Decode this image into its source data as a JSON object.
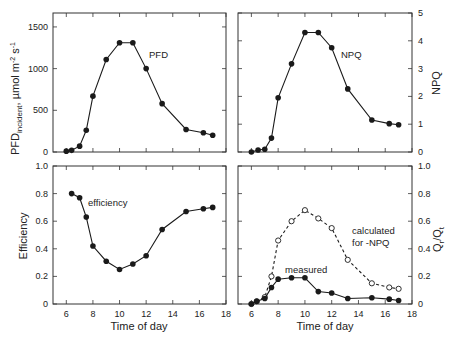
{
  "chart_data": [
    {
      "id": "pfd",
      "type": "line",
      "panel": "top-left",
      "xlabel": "",
      "ylabel": "PFD_incident, µmol m^-2 s^-1",
      "ylabel_main": "PFD",
      "ylabel_sub": "incident",
      "ylabel_units": ", µmol m",
      "xlim": [
        5,
        18
      ],
      "ylim": [
        0,
        1667
      ],
      "yticks": [
        0,
        500,
        1000,
        1500
      ],
      "xticks": [
        6,
        8,
        10,
        12,
        14,
        16,
        18
      ],
      "y_axis_side": "left",
      "annotation": {
        "text": "PFD",
        "x": 12.3,
        "y": 1140
      },
      "series": [
        {
          "name": "PFD",
          "marker": "filled-circle",
          "line": "solid",
          "x": [
            6.0,
            6.4,
            7.0,
            7.5,
            8.0,
            9.0,
            10.0,
            11.0,
            12.0,
            13.2,
            15.0,
            16.3,
            17.0
          ],
          "y": [
            10,
            20,
            70,
            260,
            670,
            1110,
            1310,
            1310,
            1000,
            580,
            270,
            230,
            200
          ]
        }
      ]
    },
    {
      "id": "npq",
      "type": "line",
      "panel": "top-right",
      "xlabel": "",
      "ylabel": "NPQ",
      "xlim": [
        5,
        18
      ],
      "ylim": [
        0,
        5
      ],
      "yticks": [
        0,
        1,
        2,
        3,
        4,
        5
      ],
      "xticks": [
        6,
        8,
        10,
        12,
        14,
        16,
        18
      ],
      "y_axis_side": "right",
      "annotation": {
        "text": "NPQ",
        "x": 12.4,
        "y": 3.55
      },
      "series": [
        {
          "name": "NPQ",
          "marker": "filled-circle",
          "line": "solid",
          "x": [
            6.0,
            6.5,
            7.0,
            7.5,
            8.0,
            9.0,
            10.0,
            11.0,
            12.0,
            13.2,
            15.0,
            16.3,
            17.0
          ],
          "y": [
            0.0,
            0.07,
            0.1,
            0.5,
            1.95,
            3.17,
            4.3,
            4.3,
            3.75,
            2.27,
            1.15,
            1.02,
            0.98
          ]
        }
      ]
    },
    {
      "id": "efficiency",
      "type": "line",
      "panel": "bottom-left",
      "xlabel": "Time of day",
      "ylabel": "Efficiency",
      "xlim": [
        5,
        18
      ],
      "ylim": [
        0,
        1.0
      ],
      "yticks": [
        0,
        0.2,
        0.4,
        0.6,
        0.8,
        1.0
      ],
      "ytick_labels": [
        "0",
        "0.2",
        "0.4",
        "0.6",
        "0.8",
        "1.0"
      ],
      "xticks": [
        6,
        8,
        10,
        12,
        14,
        16,
        18
      ],
      "y_axis_side": "left",
      "annotation": {
        "text": "efficiency",
        "x": 7.7,
        "y": 0.72
      },
      "series": [
        {
          "name": "efficiency",
          "marker": "filled-circle",
          "line": "solid",
          "x": [
            6.4,
            7.0,
            7.5,
            8.0,
            9.0,
            10.0,
            11.0,
            12.0,
            13.2,
            15.0,
            16.3,
            17.0
          ],
          "y": [
            0.8,
            0.77,
            0.63,
            0.42,
            0.31,
            0.25,
            0.29,
            0.35,
            0.54,
            0.67,
            0.69,
            0.7
          ]
        }
      ]
    },
    {
      "id": "qr_qt",
      "type": "line",
      "panel": "bottom-right",
      "xlabel": "Time of day",
      "ylabel": "Q_r/Q_t",
      "xlim": [
        5,
        18
      ],
      "ylim": [
        0,
        1.0
      ],
      "yticks": [
        0,
        0.2,
        0.4,
        0.6,
        0.8,
        1.0
      ],
      "ytick_labels": [
        "0",
        "0.2",
        "0.4",
        "0.6",
        "0.8",
        "1.0"
      ],
      "xticks": [
        6,
        8,
        10,
        12,
        14,
        16,
        18
      ],
      "y_axis_side": "right",
      "annotations": [
        {
          "text": "calculated",
          "x": 12.7,
          "y": 0.53
        },
        {
          "text": "for -NPQ",
          "x": 12.7,
          "y": 0.46
        },
        {
          "text": "measured",
          "x": 8.5,
          "y": 0.23
        }
      ],
      "series": [
        {
          "name": "calculated for -NPQ",
          "marker": "open-circle",
          "line": "dashed",
          "x": [
            6.0,
            6.4,
            7.0,
            7.5,
            8.0,
            9.0,
            10.0,
            11.0,
            12.0,
            13.2,
            15.0,
            16.3,
            17.0
          ],
          "y": [
            0.0,
            0.02,
            0.05,
            0.2,
            0.46,
            0.6,
            0.68,
            0.62,
            0.55,
            0.32,
            0.15,
            0.12,
            0.11
          ]
        },
        {
          "name": "measured",
          "marker": "filled-circle",
          "line": "solid",
          "x": [
            6.0,
            6.4,
            7.0,
            7.5,
            8.0,
            9.0,
            10.0,
            11.0,
            12.0,
            13.2,
            15.0,
            16.3,
            17.0
          ],
          "y": [
            0.0,
            0.02,
            0.04,
            0.12,
            0.18,
            0.19,
            0.19,
            0.09,
            0.08,
            0.04,
            0.045,
            0.035,
            0.025
          ]
        }
      ]
    }
  ],
  "panels": {
    "pfd_label": "PFD",
    "npq_label": "NPQ",
    "efficiency_label": "efficiency",
    "calculated_label_1": "calculated",
    "calculated_label_2": "for -NPQ",
    "measured_label": "measured",
    "x_title_left": "Time of day",
    "x_title_right": "Time of day",
    "y_title_pfd_main": "PFD",
    "y_title_pfd_sub": "incident",
    "y_title_pfd_units": ", µmol m",
    "y_title_pfd_exp1": "-2",
    "y_title_pfd_s": " s",
    "y_title_pfd_exp2": "-1",
    "y_title_npq": "NPQ",
    "y_title_eff": "Efficiency",
    "y_title_q_main": "Q",
    "y_title_q_sub1": "r",
    "y_title_q_sep": "/Q",
    "y_title_q_sub2": "t"
  },
  "colors": {
    "ink": "#1a1a1a",
    "frame": "#333333",
    "background": "#ffffff"
  }
}
